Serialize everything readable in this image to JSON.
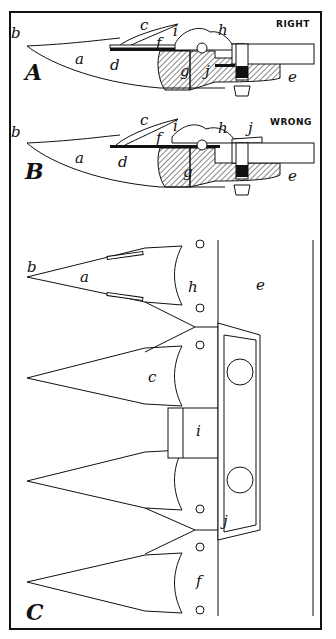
{
  "figure": {
    "panels": [
      {
        "id": "A",
        "caption": "RIGHT",
        "labels": {
          "a": "a",
          "b": "b",
          "c": "c",
          "d": "d",
          "e": "e",
          "f": "f",
          "g": "g",
          "h": "h",
          "i": "i",
          "j": "j"
        }
      },
      {
        "id": "B",
        "caption": "WRONG",
        "labels": {
          "a": "a",
          "b": "b",
          "c": "c",
          "d": "d",
          "e": "e",
          "f": "f",
          "g": "g",
          "h": "h",
          "i": "i",
          "j": "j"
        }
      },
      {
        "id": "C",
        "caption": "",
        "labels": {
          "a": "a",
          "b": "b",
          "c": "c",
          "e": "e",
          "f": "f",
          "h": "h",
          "i": "i",
          "j": "j"
        }
      }
    ],
    "colors": {
      "ink": "#111111",
      "paper": "#ffffff"
    }
  }
}
